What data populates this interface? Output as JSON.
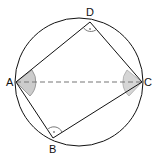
{
  "diagram": {
    "type": "cyclic-quadrilateral",
    "circle": {
      "cx": 79,
      "cy": 82,
      "r": 64
    },
    "points": {
      "A": {
        "label": "A",
        "x": 16,
        "y": 82
      },
      "B": {
        "label": "B",
        "x": 53,
        "y": 138
      },
      "C": {
        "label": "C",
        "x": 142,
        "y": 82
      },
      "D": {
        "label": "D",
        "x": 90,
        "y": 22
      }
    },
    "edges": [
      "AD",
      "DC",
      "CB",
      "BA"
    ],
    "dashed": [
      "AC"
    ],
    "marked_angles": {
      "shaded": [
        "A",
        "C"
      ],
      "right": [
        "B",
        "D"
      ]
    },
    "colors": {
      "stroke": "#111111",
      "shade": "#cccccc",
      "dash": "#777777"
    }
  }
}
